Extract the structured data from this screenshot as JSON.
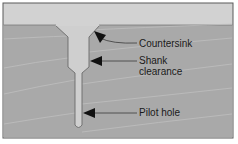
{
  "diagram": {
    "colors": {
      "background": "#ffffff",
      "frame": "#5a5a5a",
      "air": "#d2d2d2",
      "wood": "#a9a9a9",
      "grain": "#c4c4c4",
      "hole": "#cfcfcf",
      "hole_edge": "#6a6a6a",
      "arrow": "#111111",
      "leader": "#3a3a3a",
      "text": "#1a1a1a"
    },
    "labels": {
      "countersink": "Countersink",
      "shank_line1": "Shank",
      "shank_line2": "clearance",
      "pilot": "Pilot hole"
    }
  }
}
